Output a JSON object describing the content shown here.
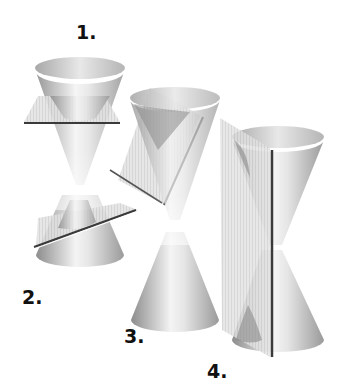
{
  "diagram": {
    "figures": [
      {
        "id": 1,
        "label": "1.",
        "plane": "horizontal"
      },
      {
        "id": 2,
        "label": "2.",
        "plane": "tilted"
      },
      {
        "id": 3,
        "label": "3.",
        "plane": "parallel to side"
      },
      {
        "id": 4,
        "label": "4.",
        "plane": "vertical"
      }
    ],
    "colors": {
      "background": "#ffffff",
      "cone_light": "#f2f2f2",
      "cone_dark": "#8a8a8a",
      "plane_fill": "#d9d9d9",
      "plane_edge": "#3a3a3a",
      "label": "#111111"
    }
  }
}
